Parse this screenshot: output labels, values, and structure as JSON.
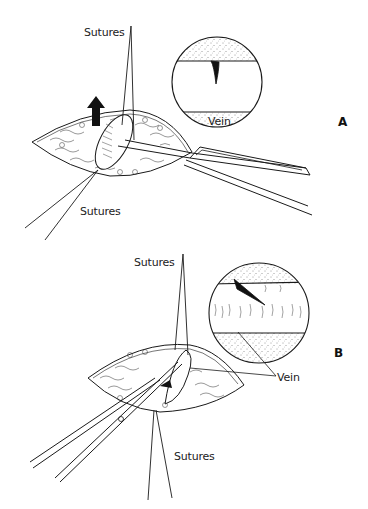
{
  "figure": {
    "panels": [
      {
        "id": "A",
        "label": "A",
        "labels": {
          "sutures_top": "Sutures",
          "sutures_bottom": "Sutures",
          "vein_inset": "Vein"
        },
        "elements": [
          "incision",
          "lifted-vein",
          "upward-arrow",
          "forceps",
          "magnified-inset-circle"
        ]
      },
      {
        "id": "B",
        "label": "B",
        "labels": {
          "sutures_top": "Sutures",
          "sutures_bottom": "Sutures",
          "vein": "Vein"
        },
        "elements": [
          "incision",
          "vein",
          "scissors",
          "magnified-inset-circle"
        ]
      }
    ],
    "colors": {
      "line": "#1a1a1a",
      "background": "#ffffff",
      "fill_dark": "#111111"
    }
  }
}
